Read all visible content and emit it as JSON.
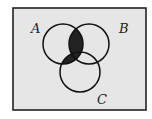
{
  "diagram": {
    "type": "venn",
    "sets": [
      {
        "label": "A",
        "cx": 63,
        "cy": 44,
        "r": 20
      },
      {
        "label": "B",
        "cx": 89,
        "cy": 44,
        "r": 20
      },
      {
        "label": "C",
        "cx": 80,
        "cy": 72,
        "r": 20
      }
    ],
    "label_positions": {
      "A": {
        "x": 31,
        "y": 33
      },
      "B": {
        "x": 119,
        "y": 33
      },
      "C": {
        "x": 97,
        "y": 104
      }
    },
    "shaded_region": "A ∩ (B ∪ C)",
    "colors": {
      "background": "#e6e6e6",
      "frame": "#222222",
      "shade": "#222222",
      "outline": "#111111"
    }
  }
}
